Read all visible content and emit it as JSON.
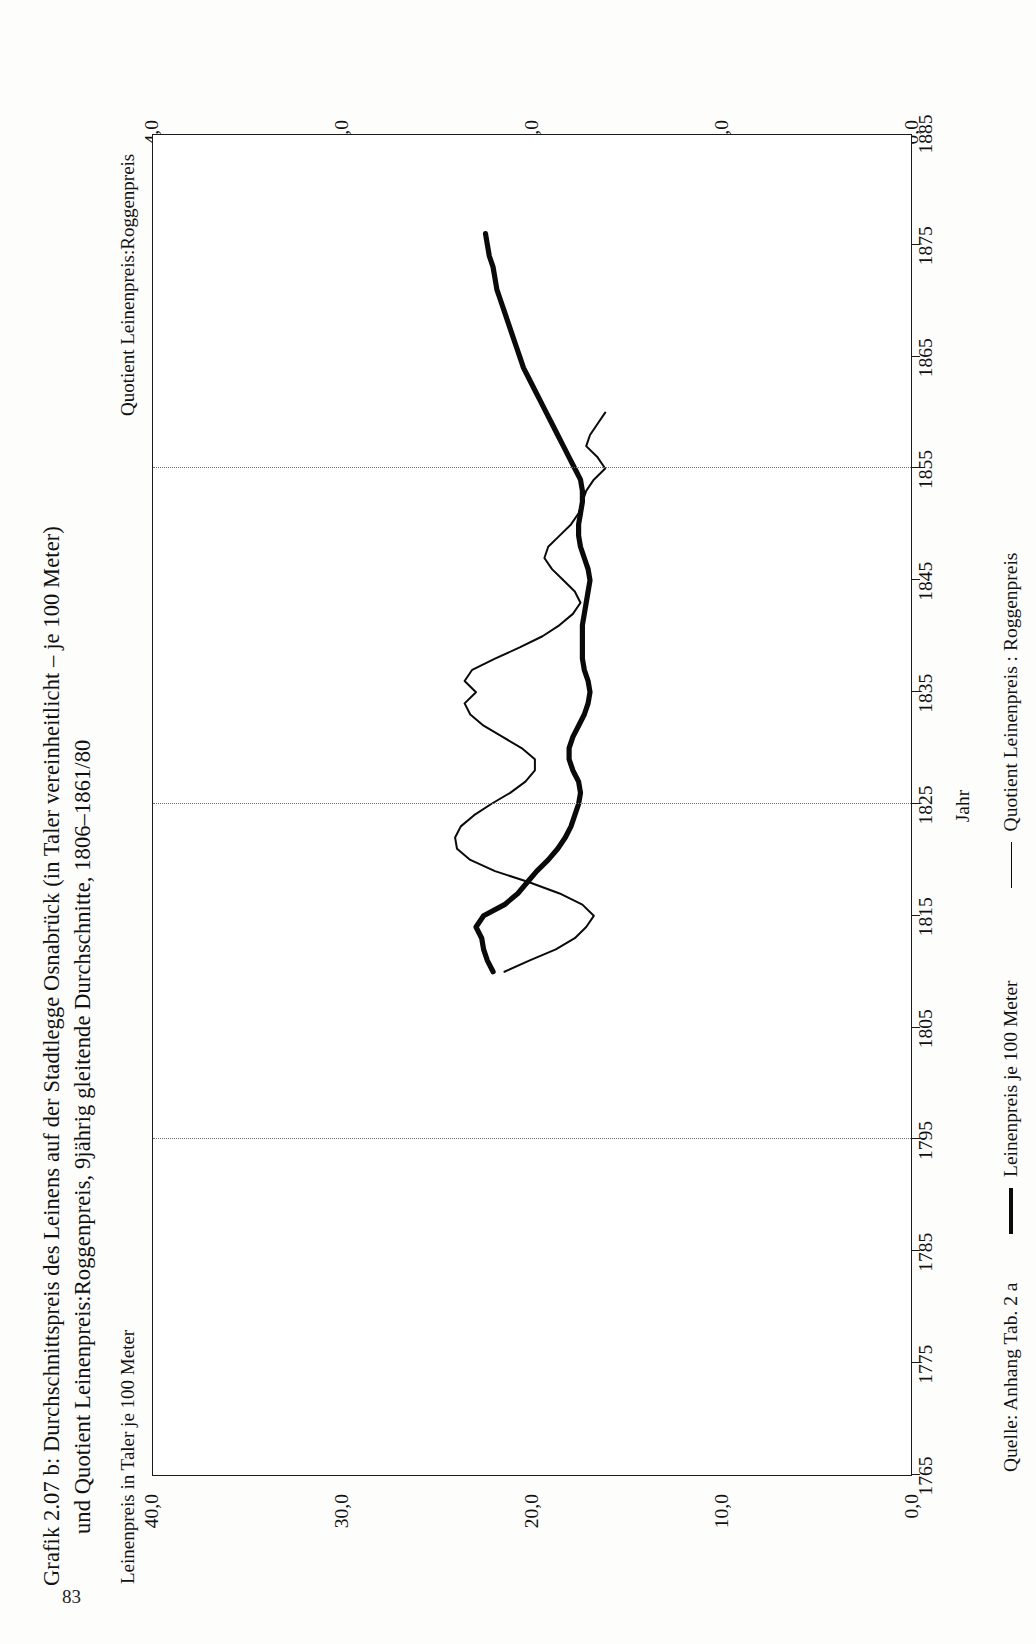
{
  "figure": {
    "caption_line1": "Grafik 2.07 b:  Durchschnittspreis des Leinens auf der Stadtlegge Osnabrück (in Taler vereinheitlicht – je 100 Meter)",
    "caption_line2": "und Quotient Leinenpreis:Roggenpreis, 9jährig gleitende Durchschnitte, 1806–1861/80",
    "left_axis_label": "Leinenpreis in Taler je 100 Meter",
    "right_axis_label": "Quotient Leinenpreis:Roggenpreis",
    "source": "Quelle: Anhang Tab. 2 a",
    "page_number": "83"
  },
  "legend": {
    "items": [
      {
        "label": "Leinenpreis je 100 Meter",
        "style": "thick",
        "color": "#0a0a0a"
      },
      {
        "label": "Quotient Leinenpreis : Roggenpreis",
        "style": "thin",
        "color": "#0a0a0a"
      }
    ]
  },
  "chart_data": {
    "type": "line",
    "xlabel": "Jahr",
    "ylabel": "Leinenpreis in Taler je 100 Meter",
    "y2label": "Quotient Leinenpreis:Roggenpreis",
    "xlim": [
      1765,
      1885
    ],
    "ylim": [
      0,
      40
    ],
    "y2lim": [
      0,
      4
    ],
    "grid": "vertical dotted at 1795, 1825, 1855",
    "legend_position": "below axes",
    "xticks": [
      1765,
      1775,
      1785,
      1795,
      1805,
      1815,
      1825,
      1835,
      1845,
      1855,
      1865,
      1875,
      1885
    ],
    "xtick_labels": [
      "1765",
      "1775",
      "1785",
      "1795",
      "1805",
      "1815",
      "1825",
      "1835",
      "1845",
      "1855",
      "1865",
      "1875",
      "1885"
    ],
    "yticks": [
      0,
      10,
      20,
      30,
      40
    ],
    "ytick_labels": [
      "0,0",
      "10,0",
      "20,0",
      "30,0",
      "40,0"
    ],
    "y2ticks": [
      0,
      1,
      2,
      3,
      4
    ],
    "y2tick_labels": [
      "0,0",
      "1,0",
      "2,0",
      "3,0",
      "4,0"
    ],
    "gridlines_x": [
      1795,
      1825,
      1855
    ],
    "series": [
      {
        "name": "Leinenpreis je 100 Meter",
        "axis": "left",
        "style": "thick",
        "x": [
          1810,
          1811,
          1812,
          1813,
          1814,
          1815,
          1816,
          1817,
          1818,
          1819,
          1820,
          1821,
          1822,
          1823,
          1824,
          1825,
          1826,
          1827,
          1828,
          1829,
          1830,
          1831,
          1832,
          1833,
          1834,
          1835,
          1836,
          1837,
          1838,
          1839,
          1840,
          1841,
          1842,
          1843,
          1844,
          1845,
          1846,
          1847,
          1848,
          1849,
          1850,
          1851,
          1852,
          1853,
          1854,
          1855,
          1856,
          1857,
          1858,
          1859,
          1860,
          1861,
          1862,
          1863,
          1864,
          1865,
          1866,
          1867,
          1868,
          1869,
          1870,
          1871,
          1872,
          1873,
          1874,
          1875,
          1876
        ],
        "y": [
          22.1,
          22.4,
          22.6,
          22.7,
          23.0,
          22.6,
          21.5,
          20.8,
          20.3,
          19.8,
          19.2,
          18.7,
          18.3,
          18.0,
          17.8,
          17.6,
          17.5,
          17.6,
          17.9,
          18.1,
          18.1,
          17.9,
          17.6,
          17.3,
          17.1,
          17.0,
          17.1,
          17.3,
          17.4,
          17.4,
          17.4,
          17.4,
          17.3,
          17.2,
          17.1,
          17.0,
          17.1,
          17.3,
          17.5,
          17.6,
          17.6,
          17.5,
          17.4,
          17.4,
          17.5,
          17.8,
          18.1,
          18.4,
          18.7,
          19.0,
          19.3,
          19.6,
          19.9,
          20.2,
          20.5,
          20.7,
          20.9,
          21.1,
          21.3,
          21.5,
          21.7,
          21.9,
          22.0,
          22.1,
          22.3,
          22.4,
          22.5
        ],
        "note": "thick line, left axis (Taler). Starts ~22 at 1810, rises slightly to ~23 by 1814, declines to a trough ~17.0 around 1835 and ~17.0–17.4 through the 1840s, then rises steadily to ~22.5 by 1876."
      },
      {
        "name": "Quotient Leinenpreis : Roggenpreis",
        "axis": "right",
        "style": "thin",
        "x": [
          1810,
          1811,
          1812,
          1813,
          1814,
          1815,
          1816,
          1817,
          1818,
          1819,
          1820,
          1821,
          1822,
          1823,
          1824,
          1825,
          1826,
          1827,
          1828,
          1829,
          1830,
          1831,
          1832,
          1833,
          1834,
          1835,
          1836,
          1837,
          1838,
          1839,
          1840,
          1841,
          1842,
          1843,
          1844,
          1845,
          1846,
          1847,
          1848,
          1849,
          1850,
          1851,
          1852,
          1853,
          1854,
          1855,
          1856,
          1857,
          1858,
          1859,
          1860
        ],
        "y": [
          2.15,
          2.02,
          1.88,
          1.78,
          1.72,
          1.68,
          1.74,
          1.86,
          2.02,
          2.2,
          2.33,
          2.4,
          2.41,
          2.38,
          2.31,
          2.22,
          2.12,
          2.04,
          1.99,
          1.99,
          2.06,
          2.16,
          2.26,
          2.33,
          2.36,
          2.3,
          2.36,
          2.32,
          2.2,
          2.07,
          1.95,
          1.86,
          1.79,
          1.75,
          1.78,
          1.84,
          1.9,
          1.94,
          1.92,
          1.86,
          1.8,
          1.76,
          1.74,
          1.72,
          1.68,
          1.62,
          1.66,
          1.72,
          1.7,
          1.66,
          1.62
        ],
        "note": "thin line, right axis (ratio). Opens ~2.15 in 1810, dips to ~1.68 at 1815, peaks ~2.41 about 1822, dips ~1.99 about 1828, second peak ~2.36 near 1834–1836, falls to ~1.75 by 1843, small bump ~1.94 at 1847, ends ~1.62–1.66 near 1857."
      }
    ]
  }
}
